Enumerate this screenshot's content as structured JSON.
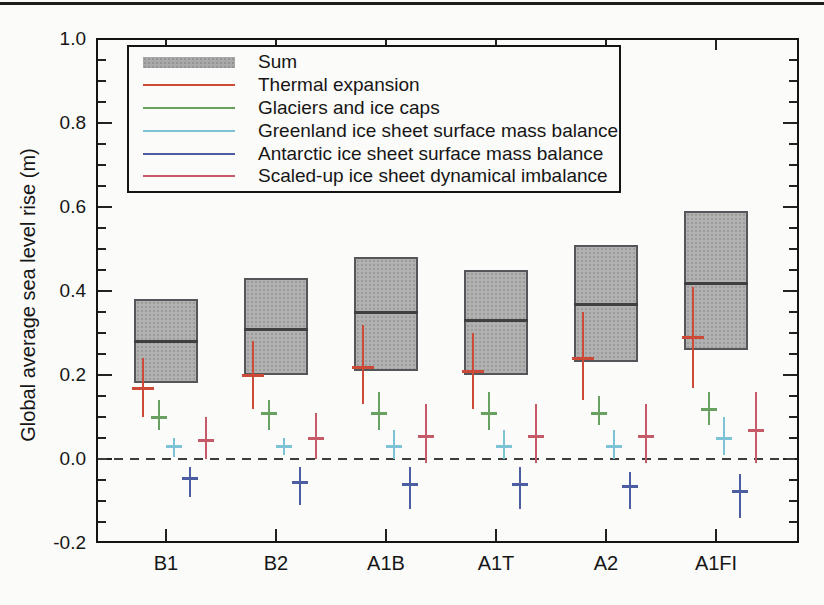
{
  "page": {
    "background": "#fbfbf9",
    "top_rule_color": "#1c1c1c"
  },
  "chart_data": {
    "type": "bar",
    "subtype": "box-ranges-with-component-error-bars",
    "title": "",
    "xlabel": "",
    "ylabel": "Global average sea level rise (m)",
    "ylim": [
      -0.2,
      1.0
    ],
    "ytick_step": 0.2,
    "yminor_step": 0.05,
    "ytick_labels": [
      "1.0",
      "0.8",
      "0.6",
      "0.4",
      "0.2",
      "0.0",
      "-0.2"
    ],
    "ytick_values": [
      1.0,
      0.8,
      0.6,
      0.4,
      0.2,
      0.0,
      -0.2
    ],
    "zero_dashed_line": true,
    "grid": false,
    "legend_position": "top-left-inside",
    "categories": [
      "B1",
      "B2",
      "A1B",
      "A1T",
      "A2",
      "A1FI"
    ],
    "sum": {
      "label": "Sum",
      "fill_color": "#b1b1b1",
      "border_color": "#55565a",
      "low": [
        0.18,
        0.2,
        0.21,
        0.2,
        0.23,
        0.26
      ],
      "central": [
        0.28,
        0.31,
        0.35,
        0.33,
        0.37,
        0.42
      ],
      "high": [
        0.38,
        0.43,
        0.48,
        0.45,
        0.51,
        0.59
      ]
    },
    "series": [
      {
        "name": "Thermal expansion",
        "color": "#cd4a38",
        "low": [
          0.1,
          0.12,
          0.13,
          0.12,
          0.14,
          0.17
        ],
        "central": [
          0.17,
          0.2,
          0.22,
          0.21,
          0.24,
          0.29
        ],
        "high": [
          0.24,
          0.28,
          0.32,
          0.3,
          0.35,
          0.41
        ]
      },
      {
        "name": "Glaciers and ice caps",
        "color": "#69a163",
        "low": [
          0.07,
          0.07,
          0.07,
          0.07,
          0.08,
          0.08
        ],
        "central": [
          0.1,
          0.11,
          0.11,
          0.11,
          0.11,
          0.12
        ],
        "high": [
          0.14,
          0.14,
          0.16,
          0.16,
          0.15,
          0.16
        ]
      },
      {
        "name": "Greenland ice sheet surface mass balance",
        "color": "#7cc3d6",
        "low": [
          0.005,
          0.01,
          0.0,
          0.0,
          0.0,
          0.01
        ],
        "central": [
          0.03,
          0.03,
          0.03,
          0.03,
          0.03,
          0.05
        ],
        "high": [
          0.05,
          0.05,
          0.07,
          0.07,
          0.07,
          0.1
        ]
      },
      {
        "name": "Antarctic ice sheet surface mass balance",
        "color": "#4d5da1",
        "low": [
          -0.09,
          -0.11,
          -0.12,
          -0.12,
          -0.12,
          -0.14
        ],
        "central": [
          -0.045,
          -0.055,
          -0.06,
          -0.06,
          -0.065,
          -0.075
        ],
        "high": [
          -0.02,
          -0.02,
          -0.02,
          -0.02,
          -0.03,
          -0.035
        ]
      },
      {
        "name": "Scaled-up ice sheet dynamical imbalance",
        "color": "#c75a68",
        "low": [
          0.0,
          0.0,
          -0.01,
          -0.01,
          -0.01,
          -0.01
        ],
        "central": [
          0.045,
          0.05,
          0.055,
          0.055,
          0.055,
          0.07
        ],
        "high": [
          0.1,
          0.11,
          0.13,
          0.13,
          0.13,
          0.16
        ]
      }
    ]
  }
}
